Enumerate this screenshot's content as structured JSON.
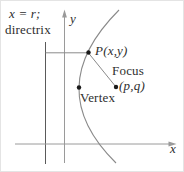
{
  "figure": {
    "labels": {
      "directrix_equation": "x = r;",
      "directrix_word": "directrix",
      "y_axis": "y",
      "x_axis": "x",
      "point_p": "P(x,y)",
      "focus_word": "Focus",
      "focus_coords": "(p,q)",
      "vertex_word": "Vertex"
    },
    "colors": {
      "background": "#ffffff",
      "axis": "#9a9a9a",
      "directrix": "#5a5a5a",
      "curve": "#8a8a8a",
      "segment": "#8a8a8a",
      "dot": "#1a1a1a",
      "text": "#2e2e2e"
    }
  }
}
